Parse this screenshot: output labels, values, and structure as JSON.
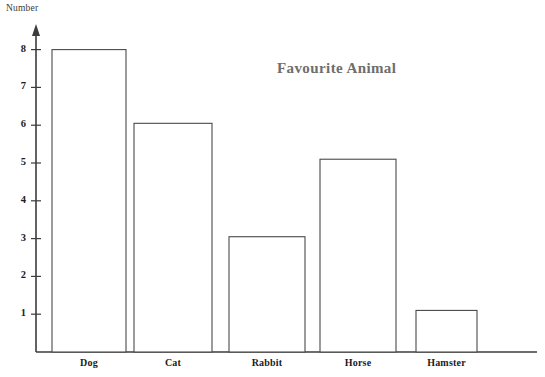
{
  "chart_data": {
    "type": "bar",
    "title": "Favourite Animal",
    "xlabel": "",
    "ylabel": "Number",
    "categories": [
      "Dog",
      "Cat",
      "Rabbit",
      "Horse",
      "Hamster"
    ],
    "values": [
      8,
      6.05,
      3.05,
      5.1,
      1.1
    ],
    "ylim": [
      0,
      8.6
    ],
    "yticks": [
      1,
      2,
      3,
      4,
      5,
      6,
      7,
      8
    ],
    "ytick_labels": [
      "1",
      "2",
      "3",
      "4",
      "5",
      "6",
      "7",
      "8"
    ],
    "grid": false,
    "legend": false,
    "legend_position": "none",
    "bar_fill": "#ffffff",
    "bar_edge_color": "#4a4a4a",
    "axis_color": "#3c3c3c",
    "title_color": "#6e6e6e",
    "background": "#ffffff",
    "y_axis_has_arrow": true
  },
  "geometry": {
    "baseline_y": 352,
    "axis_x": 36,
    "unit_px": 37.8,
    "bars": [
      {
        "x": 52,
        "width": 74
      },
      {
        "x": 134,
        "width": 78
      },
      {
        "x": 229,
        "width": 76
      },
      {
        "x": 320,
        "width": 76
      },
      {
        "x": 416,
        "width": 61
      }
    ],
    "baseline_right": 537,
    "axis_top": 27
  }
}
